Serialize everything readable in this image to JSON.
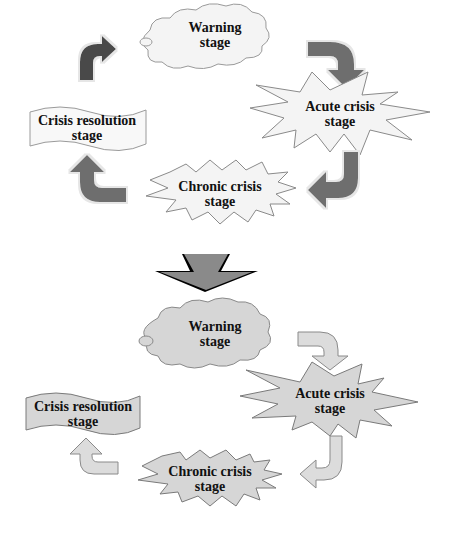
{
  "diagram": {
    "title": "",
    "colors": {
      "top_arrow_fill": "#6e6e6e",
      "top_shape_fill": "#f4f4f4",
      "bottom_shape_fill": "#d6d6d6",
      "bottom_arrow_fill": "#dcdcdc",
      "transition_arrow_fill": "#8a8a8a",
      "stroke": "#7a7a7a",
      "text": "#111111"
    },
    "top_cycle": {
      "stages": [
        {
          "id": "warning",
          "line1": "Warning",
          "line2": "stage",
          "shape": "cloud"
        },
        {
          "id": "acute",
          "line1": "Acute crisis",
          "line2": "stage",
          "shape": "starburst"
        },
        {
          "id": "chronic",
          "line1": "Chronic crisis",
          "line2": "stage",
          "shape": "starburst"
        },
        {
          "id": "resolution",
          "line1": "Crisis resolution",
          "line2": "stage",
          "shape": "wave-banner"
        }
      ],
      "arrows": [
        "warning-to-acute",
        "acute-to-chronic",
        "chronic-to-resolution",
        "resolution-to-warning"
      ]
    },
    "transition_arrow": "down",
    "bottom_flow": {
      "stages": [
        {
          "id": "warning",
          "line1": "Warning",
          "line2": "stage",
          "shape": "cloud"
        },
        {
          "id": "acute",
          "line1": "Acute crisis",
          "line2": "stage",
          "shape": "starburst"
        },
        {
          "id": "chronic",
          "line1": "Chronic crisis",
          "line2": "stage",
          "shape": "starburst"
        },
        {
          "id": "resolution",
          "line1": "Crisis resolution",
          "line2": "stage",
          "shape": "wave-banner"
        }
      ],
      "arrows": [
        "warning-to-acute",
        "acute-to-chronic",
        "chronic-to-resolution"
      ]
    }
  }
}
